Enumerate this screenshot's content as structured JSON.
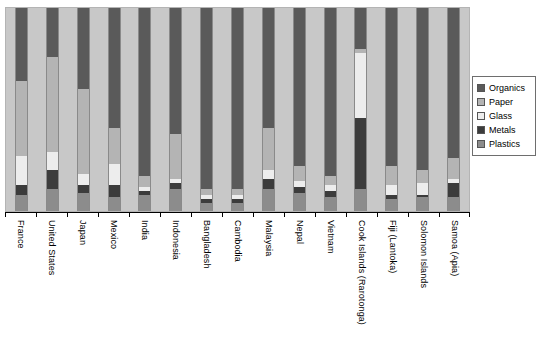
{
  "chart_data": {
    "type": "bar",
    "subtype": "stacked-bar-100-percent",
    "title": "",
    "subtitle": "",
    "xlabel": "",
    "ylabel": "",
    "ylim": [
      0,
      100
    ],
    "grid": false,
    "legend_position": "right",
    "orientation": "vertical",
    "stack_order_top_to_bottom": [
      "Organics",
      "Paper",
      "Glass",
      "Metals",
      "Plastics"
    ],
    "categories": [
      "France",
      "United States",
      "Japan",
      "Mexico",
      "India",
      "Indonesia",
      "Bangladesh",
      "Cambodia",
      "Malaysia",
      "Nepal",
      "Vietnam",
      "Cook Islands (Rarotonga)",
      "Fiji (Lantoka)",
      "Solomon Islands",
      "Samoa (Apia)"
    ],
    "series": [
      {
        "name": "Organics",
        "color": "#5a5a5a",
        "values": [
          36,
          24,
          40,
          59,
          83,
          62,
          89,
          89,
          59,
          78,
          83,
          20,
          78,
          80,
          74
        ]
      },
      {
        "name": "Paper",
        "color": "#b4b4b4",
        "values": [
          37,
          47,
          42,
          18,
          5,
          22,
          3,
          3,
          21,
          7,
          4,
          2,
          9,
          6,
          10
        ]
      },
      {
        "name": "Glass",
        "color": "#ededed",
        "values": [
          14,
          9,
          5,
          10,
          2,
          2,
          2,
          2,
          4,
          3,
          3,
          32,
          5,
          6,
          2
        ]
      },
      {
        "name": "Metals",
        "color": "#3c3c3c",
        "values": [
          5,
          9,
          4,
          6,
          2,
          3,
          2,
          2,
          5,
          3,
          3,
          35,
          2,
          1,
          7
        ]
      },
      {
        "name": "Plastics",
        "color": "#8c8c8c",
        "values": [
          8,
          11,
          9,
          7,
          8,
          11,
          4,
          4,
          11,
          9,
          7,
          11,
          6,
          7,
          7
        ]
      }
    ],
    "axis_tick_labels_y": []
  },
  "legend": {
    "items": [
      {
        "label": "Organics",
        "color": "#5a5a5a"
      },
      {
        "label": "Paper",
        "color": "#b4b4b4"
      },
      {
        "label": "Glass",
        "color": "#ededed"
      },
      {
        "label": "Metals",
        "color": "#3c3c3c"
      },
      {
        "label": "Plastics",
        "color": "#8c8c8c"
      }
    ]
  },
  "style": {
    "plot_background": "#c8c8c8",
    "page_background": "#ffffff",
    "axis_color": "#000000",
    "bar_outline": "#8a8a8a",
    "legend_border": "#6e6e6e"
  }
}
